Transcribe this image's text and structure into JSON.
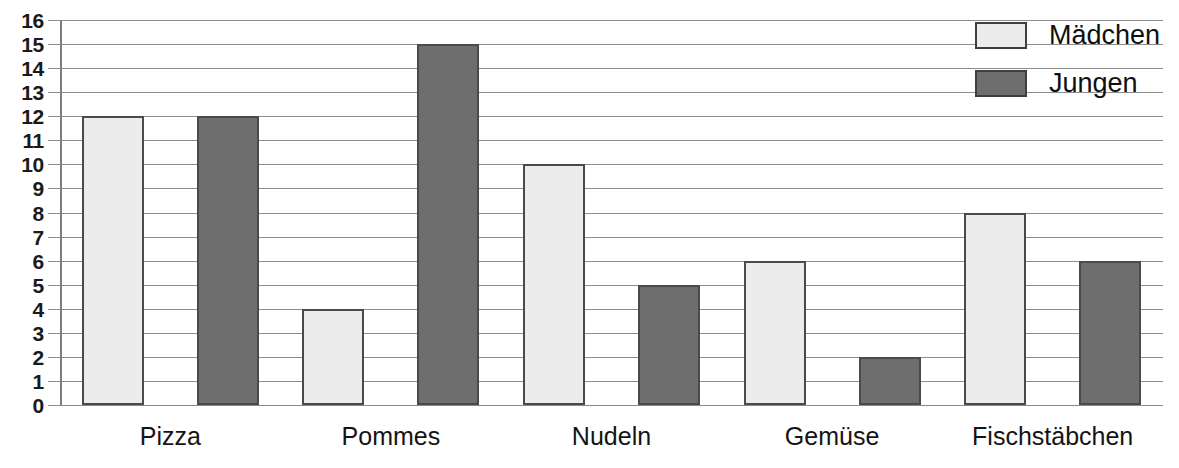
{
  "chart_data": {
    "type": "bar",
    "title": "",
    "subtitle": "",
    "xlabel": "",
    "ylabel": "",
    "categories": [
      "Pizza",
      "Pommes",
      "Nudeln",
      "Gemüse",
      "Fischstäbchen"
    ],
    "series": [
      {
        "name": "Mädchen",
        "values": [
          12,
          4,
          10,
          6,
          8
        ],
        "color": "#ececec"
      },
      {
        "name": "Jungen",
        "values": [
          12,
          15,
          5,
          2,
          6
        ],
        "color": "#6e6e6e"
      }
    ],
    "ylim": [
      0,
      16
    ],
    "ytick_labels": [
      "16",
      "15",
      "14",
      "13",
      "12",
      "11",
      "10",
      "9",
      "8",
      "7",
      "6",
      "5",
      "4",
      "3",
      "2",
      "1",
      "0"
    ],
    "ytick_values": [
      16,
      15,
      14,
      13,
      12,
      11,
      10,
      9,
      8,
      7,
      6,
      5,
      4,
      3,
      2,
      1,
      0
    ],
    "grid": true,
    "legend_position": "top-right",
    "annotations": []
  },
  "legend": {
    "entries": [
      {
        "label": "Mädchen",
        "swatch": "light-gray"
      },
      {
        "label": "Jungen",
        "swatch": "dark-gray"
      }
    ]
  },
  "colors": {
    "girls_fill": "#ececec",
    "boys_fill": "#6e6e6e",
    "bar_border": "#4a4a4a",
    "gridline": "#8e8e8e",
    "axis": "#7d7d7d",
    "text": "#141414",
    "background": "#ffffff"
  }
}
